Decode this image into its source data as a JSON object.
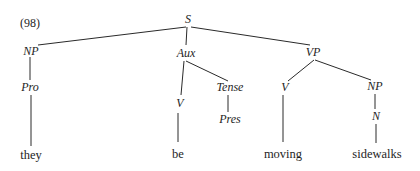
{
  "example_number": "(98)",
  "tree": {
    "nodes": {
      "S": {
        "label": "S",
        "x": 188,
        "y": 23
      },
      "NP1": {
        "label": "NP",
        "x": 31,
        "y": 53
      },
      "Aux": {
        "label": "Aux",
        "x": 185,
        "y": 55
      },
      "VP": {
        "label": "VP",
        "x": 313,
        "y": 55
      },
      "Pro": {
        "label": "Pro",
        "x": 30,
        "y": 90
      },
      "V1": {
        "label": "V",
        "x": 180,
        "y": 105
      },
      "Tense": {
        "label": "Tense",
        "x": 232,
        "y": 90
      },
      "Pres": {
        "label": "Pres",
        "x": 229,
        "y": 122
      },
      "V2": {
        "label": "V",
        "x": 285,
        "y": 90
      },
      "NP2": {
        "label": "NP",
        "x": 375,
        "y": 89
      },
      "N": {
        "label": "N",
        "x": 375,
        "y": 119
      }
    },
    "leaves": {
      "they": {
        "label": "they",
        "x": 31,
        "y": 156
      },
      "be": {
        "label": "be",
        "x": 179,
        "y": 155
      },
      "moving": {
        "label": "moving",
        "x": 284,
        "y": 155
      },
      "sidewalks": {
        "label": "sidewalks",
        "x": 375,
        "y": 155
      }
    },
    "edges": [
      [
        "S",
        "NP1"
      ],
      [
        "S",
        "Aux"
      ],
      [
        "S",
        "VP"
      ],
      [
        "NP1",
        "Pro"
      ],
      [
        "Pro",
        "they"
      ],
      [
        "Aux",
        "V1"
      ],
      [
        "Aux",
        "Tense"
      ],
      [
        "V1",
        "be"
      ],
      [
        "Tense",
        "Pres"
      ],
      [
        "VP",
        "V2"
      ],
      [
        "VP",
        "NP2"
      ],
      [
        "V2",
        "moving"
      ],
      [
        "NP2",
        "N"
      ],
      [
        "N",
        "sidewalks"
      ]
    ]
  }
}
